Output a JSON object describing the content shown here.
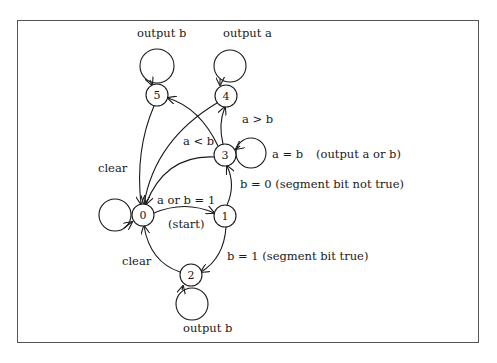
{
  "diagram": {
    "type": "state-machine",
    "states": [
      {
        "id": "0",
        "label": "0",
        "x": 143,
        "y": 215
      },
      {
        "id": "1",
        "label": "1",
        "x": 225,
        "y": 216
      },
      {
        "id": "2",
        "label": "2",
        "x": 191,
        "y": 275
      },
      {
        "id": "3",
        "label": "3",
        "x": 225,
        "y": 155
      },
      {
        "id": "4",
        "label": "4",
        "x": 226,
        "y": 96
      },
      {
        "id": "5",
        "label": "5",
        "x": 157,
        "y": 95
      }
    ],
    "labels": {
      "output_b_top": "output b",
      "output_a_top": "output a",
      "a_gt_b": "a > b",
      "a_lt_b": "a < b",
      "a_eq_b": "a = b",
      "output_a_or_b": "(output a or b)",
      "b_eq_0": "b = 0 (segment bit not true)",
      "a_or_b_eq_1": "a or b = 1",
      "start": "(start)",
      "clear_upper": "clear",
      "clear_lower": "clear",
      "b_eq_1": "b = 1 (segment bit true)",
      "output_b_bottom": "output b"
    },
    "transitions": [
      {
        "from": "0",
        "to": "0",
        "label": ""
      },
      {
        "from": "0",
        "to": "1",
        "label": "a or b = 1"
      },
      {
        "from": "1",
        "to": "3",
        "label": "b = 0 (segment bit not true)"
      },
      {
        "from": "1",
        "to": "2",
        "label": "b = 1 (segment bit true)"
      },
      {
        "from": "3",
        "to": "4",
        "label": "a > b"
      },
      {
        "from": "3",
        "to": "5",
        "label": "a < b"
      },
      {
        "from": "3",
        "to": "3",
        "label": "a = b (output a or b)"
      },
      {
        "from": "3",
        "to": "0",
        "label": ""
      },
      {
        "from": "4",
        "to": "4",
        "label": "output a"
      },
      {
        "from": "4",
        "to": "0",
        "label": ""
      },
      {
        "from": "5",
        "to": "5",
        "label": "output b"
      },
      {
        "from": "5",
        "to": "0",
        "label": "clear"
      },
      {
        "from": "2",
        "to": "2",
        "label": "output b"
      },
      {
        "from": "2",
        "to": "0",
        "label": "clear"
      }
    ]
  }
}
